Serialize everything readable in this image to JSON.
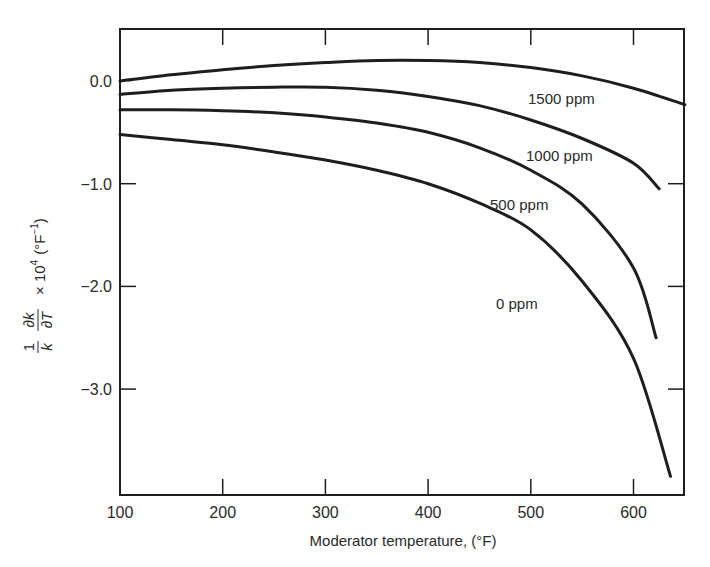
{
  "chart_data": {
    "type": "line",
    "title": "",
    "xlabel": "Moderator temperature, (°F)",
    "ylabel": "(1/k)(∂k/∂T) × 10^4 (°F^-1)",
    "ylabel_parts": {
      "frac1_num": "1",
      "frac1_den": "k",
      "frac2_num": "∂k",
      "frac2_den": "∂T",
      "scale": "× 10",
      "exp": "4",
      "unit": "(°F",
      "unit_exp": "−1",
      "unit_close": ")"
    },
    "xlim": [
      100,
      650
    ],
    "ylim": [
      -4.03,
      0.5
    ],
    "grid": false,
    "legend": "inline curve labels",
    "x_ticks": [
      100,
      200,
      300,
      400,
      500,
      600
    ],
    "x_tick_labels": [
      "100",
      "200",
      "300",
      "400",
      "500",
      "600"
    ],
    "y_ticks": [
      0.0,
      -1.0,
      -2.0,
      -3.0
    ],
    "y_tick_labels": [
      "0.0",
      "−1.0",
      "−2.0",
      "−3.0"
    ],
    "series": [
      {
        "name": "1500 ppm",
        "x": [
          100,
          150,
          200,
          250,
          300,
          350,
          400,
          450,
          500,
          550,
          600,
          650
        ],
        "values": [
          0.0,
          0.06,
          0.11,
          0.15,
          0.18,
          0.2,
          0.2,
          0.18,
          0.13,
          0.05,
          -0.07,
          -0.23
        ],
        "label_pos": [
          500,
          -0.23
        ]
      },
      {
        "name": "1000 ppm",
        "x": [
          100,
          150,
          200,
          250,
          300,
          350,
          400,
          450,
          500,
          550,
          600,
          625
        ],
        "values": [
          -0.13,
          -0.09,
          -0.07,
          -0.06,
          -0.06,
          -0.09,
          -0.15,
          -0.24,
          -0.38,
          -0.56,
          -0.8,
          -1.05
        ],
        "label_pos": [
          495,
          -0.72
        ]
      },
      {
        "name": "500 ppm",
        "x": [
          100,
          150,
          200,
          250,
          300,
          350,
          400,
          450,
          500,
          550,
          600,
          622
        ],
        "values": [
          -0.28,
          -0.28,
          -0.29,
          -0.31,
          -0.35,
          -0.41,
          -0.5,
          -0.65,
          -0.87,
          -1.2,
          -1.82,
          -2.5
        ],
        "label_pos": [
          460,
          -1.15
        ]
      },
      {
        "name": "0 ppm",
        "x": [
          100,
          150,
          200,
          250,
          300,
          350,
          400,
          450,
          500,
          550,
          600,
          636
        ],
        "values": [
          -0.52,
          -0.57,
          -0.62,
          -0.69,
          -0.77,
          -0.87,
          -1.0,
          -1.19,
          -1.45,
          -1.95,
          -2.7,
          -3.85
        ],
        "label_pos": [
          470,
          -2.15
        ]
      }
    ]
  },
  "labels": {
    "s1500": "1500 ppm",
    "s1000": "1000 ppm",
    "s500": "500 ppm",
    "s0": "0 ppm",
    "x_ticks": [
      "100",
      "200",
      "300",
      "400",
      "500",
      "600"
    ],
    "y_ticks": [
      "0.0",
      "−1.0",
      "−2.0",
      "−3.0"
    ],
    "xlabel": "Moderator temperature, (°F)"
  },
  "style": {
    "ink": "#1e1e1e",
    "background": "#ffffff"
  }
}
